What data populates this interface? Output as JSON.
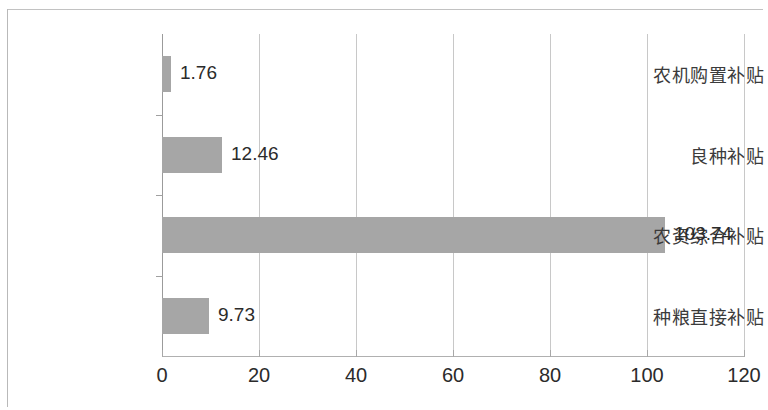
{
  "chart_data": {
    "type": "bar",
    "orientation": "horizontal",
    "title": "",
    "subtitle": "",
    "xlabel": "",
    "ylabel": "",
    "categories": [
      "农机购置补贴",
      "良种补贴",
      "农资综合补贴",
      "种粮直接补贴"
    ],
    "values": [
      1.76,
      12.46,
      103.74,
      9.73
    ],
    "value_labels": [
      "1.76",
      "12.46",
      "103.74",
      "9.73"
    ],
    "xlim": [
      0,
      120
    ],
    "xticks": [
      0,
      20,
      40,
      60,
      80,
      100,
      120
    ],
    "xtick_labels": [
      "0",
      "20",
      "40",
      "60",
      "80",
      "100",
      "120"
    ],
    "grid": "vertical",
    "legend": null,
    "bar_color": "#a6a6a6",
    "axis_color": "#b0b0b0",
    "grid_color": "#c8c8c8",
    "text_color": "#2b2b2b"
  }
}
